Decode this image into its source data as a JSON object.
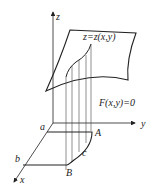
{
  "diagram": {
    "axes": {
      "x_label": "x",
      "y_label": "y",
      "z_label": "z"
    },
    "surface_label": "z=z(x,y)",
    "cylinder_label": "F(x,y)=0",
    "points": {
      "a": "a",
      "b": "b",
      "A": "A",
      "B": "B",
      "c": "c"
    },
    "colors": {
      "stroke": "#222222",
      "background": "#ffffff"
    }
  }
}
